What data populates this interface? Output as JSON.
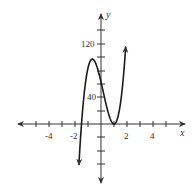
{
  "chart_data": {
    "type": "line",
    "title": "",
    "xlabel": "x",
    "ylabel": "y",
    "x_ticks": [
      -4,
      -2,
      2,
      4
    ],
    "y_ticks": [
      40,
      120
    ],
    "x_tick_step": 1,
    "y_tick_step": 20,
    "xlim": [
      -5.5,
      6.5
    ],
    "ylim": [
      -90,
      140
    ],
    "grid": false,
    "legend": null,
    "series": [
      {
        "name": "f(x)",
        "x": [
          -1.7,
          -1.5,
          -1.25,
          -1.0,
          -0.67,
          -0.5,
          -0.25,
          0,
          0.25,
          0.5,
          0.75,
          1.0,
          1.25,
          1.5,
          1.75,
          1.9
        ],
        "y": [
          -61,
          0,
          61,
          84,
          97,
          95,
          82,
          63,
          41,
          21,
          6,
          0,
          7,
          32,
          77,
          116
        ]
      }
    ],
    "annotations": [
      {
        "label": "local max",
        "x": -0.67,
        "y": 97
      },
      {
        "label": "local min",
        "x": 1,
        "y": 0
      }
    ],
    "arrows": {
      "curve_ends": true,
      "axes": true
    }
  },
  "labels": {
    "x_axis": "x",
    "y_axis": "y",
    "x_tick_neg4": "-4",
    "x_tick_neg2": "-2",
    "x_tick_2": "2",
    "x_tick_4": "4",
    "y_tick_40": "40",
    "y_tick_120": "120"
  },
  "colors": {
    "axis": "#333333",
    "curve": "#1a1a1a",
    "background": "#ffffff"
  }
}
